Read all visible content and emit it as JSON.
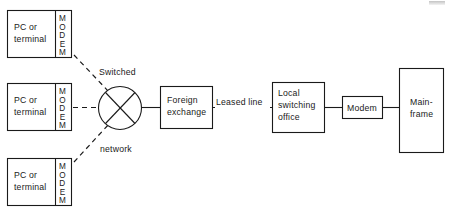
{
  "diagram": {
    "colors": {
      "ink": "#1a1a1a",
      "paper": "#ffffff"
    },
    "nodes": {
      "terminal_top": {
        "label_line1": "PC or",
        "label_line2": "terminal",
        "modem_label": "MODEM"
      },
      "terminal_middle": {
        "label_line1": "PC or",
        "label_line2": "terminal",
        "modem_label": "MODEM"
      },
      "terminal_bottom": {
        "label_line1": "PC or",
        "label_line2": "terminal",
        "modem_label": "MODEM"
      },
      "switched_network": {
        "label_line1": "Switched",
        "label_line2": "network"
      },
      "foreign_exchange": {
        "label_line1": "Foreign",
        "label_line2": "exchange"
      },
      "local_switching_office": {
        "label_line1": "Local",
        "label_line2": "switching",
        "label_line3": "office"
      },
      "modem": {
        "label": "Modem"
      },
      "mainframe": {
        "label_line1": "Main-",
        "label_line2": "frame"
      }
    },
    "edges": {
      "leased_line": {
        "label": "Leased line"
      }
    }
  }
}
